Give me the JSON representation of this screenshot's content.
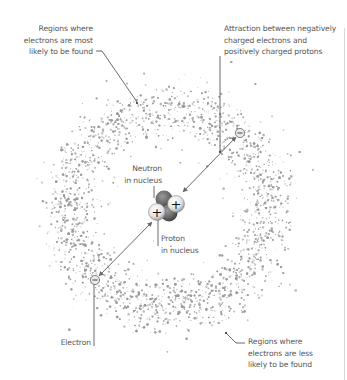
{
  "diagram": {
    "labels": {
      "most_likely": [
        "Regions where",
        "electrons are most",
        "likely to be found"
      ],
      "attraction": [
        "Attraction between negatively",
        "charged electrons and",
        "positively charged protons"
      ],
      "neutron": [
        "Neutron",
        "in nucleus"
      ],
      "proton": [
        "Proton",
        "in nucleus"
      ],
      "electron": [
        "Electron"
      ],
      "less_likely": [
        "Regions where",
        "electrons are less",
        "likely to be found"
      ]
    },
    "symbols": {
      "proton_sign": "+",
      "electron_sign": "−"
    },
    "colors": {
      "cloud": "#9a9a9a",
      "text": "#555555",
      "leader": "#444444",
      "arrow": "#6a6a6a",
      "neutron": "#6b6b6b",
      "proton": "#e8e8e8",
      "border": "#d8d8d8"
    }
  }
}
